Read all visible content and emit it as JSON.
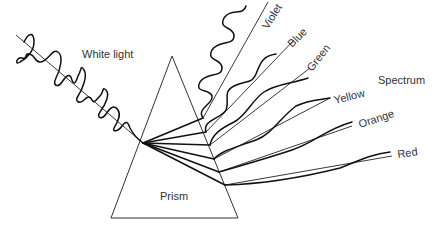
{
  "diagram": {
    "type": "prism-dispersion",
    "labels": {
      "input": "White light",
      "prism": "Prism",
      "output": "Spectrum"
    },
    "colors": [
      {
        "name": "Violet",
        "order": 1
      },
      {
        "name": "Blue",
        "order": 2
      },
      {
        "name": "Green",
        "order": 3
      },
      {
        "name": "Yellow",
        "order": 4
      },
      {
        "name": "Orange",
        "order": 5
      },
      {
        "name": "Red",
        "order": 6
      }
    ],
    "line_color": "#111111",
    "text_color": "#333333",
    "background": "#ffffff"
  }
}
